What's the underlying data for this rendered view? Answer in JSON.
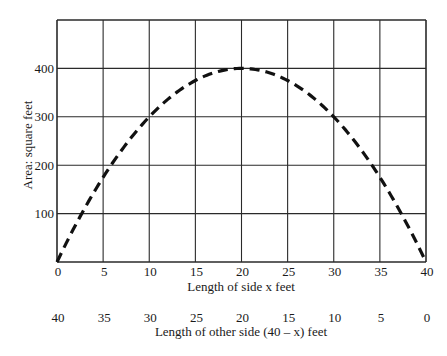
{
  "chart_data": {
    "type": "line",
    "title": "",
    "xlabel": "Length of side x feet",
    "x2label": "Length of other side (40 – x) feet",
    "ylabel": "Area: square feet",
    "xlim": [
      0,
      40
    ],
    "ylim": [
      0,
      500
    ],
    "grid": true,
    "x_ticks": [
      0,
      5,
      10,
      15,
      20,
      25,
      30,
      35,
      40
    ],
    "x_tick_labels": [
      "0",
      "5",
      "10",
      "15",
      "20",
      "25",
      "30",
      "35",
      "40"
    ],
    "x2_tick_labels": [
      "40",
      "35",
      "30",
      "25",
      "20",
      "15",
      "10",
      "5",
      "0"
    ],
    "y_ticks": [
      100,
      200,
      300,
      400
    ],
    "y_tick_labels": [
      "100",
      "200",
      "300",
      "400"
    ],
    "series": [
      {
        "name": "Area = x(40 – x)",
        "style": "dashed",
        "color": "#111111",
        "x": [
          0,
          5,
          10,
          15,
          20,
          25,
          30,
          35,
          40
        ],
        "values": [
          0,
          175,
          300,
          375,
          400,
          375,
          300,
          175,
          0
        ]
      }
    ]
  },
  "colors": {
    "grid": "#2a2a2a",
    "curve": "#111111",
    "text": "#1a1a1a",
    "background": "#ffffff"
  }
}
